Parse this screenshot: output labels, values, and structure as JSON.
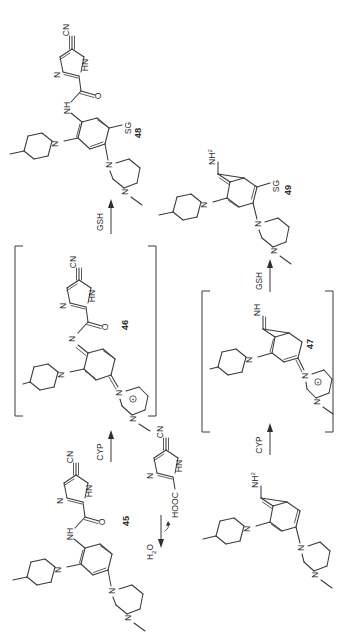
{
  "figure": {
    "type": "chemical-reaction-scheme",
    "orientation": "rotated-90-ccw",
    "background_color": "#ffffff",
    "line_color": "#3a3a3a",
    "text_color": "#2b2b2b"
  },
  "compounds": {
    "c45": {
      "label": "45",
      "atoms": {
        "cn": "CN",
        "nh_imidazole": "HN",
        "n_imidazole": "N",
        "carbonyl_o": "O",
        "amide_nh": "NH",
        "piperidine_n": "N",
        "piperazine_n1": "N",
        "piperazine_n4": "N"
      }
    },
    "c46": {
      "label": "46",
      "bracketed": true,
      "atoms": {
        "cn": "CN",
        "nh_imidazole": "HN",
        "n_imidazole": "N",
        "carbonyl_o": "O",
        "imine_n": "N",
        "piperidine_n": "N",
        "iminium_n": "N",
        "piperazine_n4": "N",
        "charge": "⊕"
      }
    },
    "c47": {
      "label": "47",
      "bracketed": true,
      "atoms": {
        "imine_nh": "NH",
        "piperidine_n": "N",
        "iminium_n": "N",
        "piperazine_n4": "N",
        "charge": "⊕"
      }
    },
    "c48": {
      "label": "48",
      "atoms": {
        "cn": "CN",
        "nh_imidazole": "HN",
        "n_imidazole": "N",
        "carbonyl_o": "O",
        "amide_nh": "NH",
        "piperidine_n": "N",
        "sg": "SG",
        "piperazine_n1": "N",
        "piperazine_n4": "N"
      }
    },
    "c49": {
      "label": "49",
      "atoms": {
        "nh2": "NH",
        "nh2_sub": "2",
        "piperidine_n": "N",
        "sg": "SG",
        "piperazine_n1": "N",
        "piperazine_n4": "N"
      }
    },
    "aniline": {
      "label": "",
      "atoms": {
        "nh2": "NH",
        "nh2_sub": "2",
        "piperidine_n": "N",
        "piperazine_n1": "N",
        "piperazine_n4": "N"
      }
    },
    "acid_fragment": {
      "label": "",
      "atoms": {
        "cn": "CN",
        "nh_imidazole": "HN",
        "n_imidazole": "N",
        "cooh": "HOOC"
      }
    }
  },
  "reactions": [
    {
      "id": "r1",
      "reagent": "CYP",
      "from": "45",
      "to": "46"
    },
    {
      "id": "r2",
      "reagent": "GSH",
      "from": "46",
      "to": "48"
    },
    {
      "id": "r3",
      "reagent": "H2O",
      "reagent_text": "H",
      "reagent_sub": "2",
      "reagent_tail": "O",
      "from": "45",
      "to": "aniline"
    },
    {
      "id": "r4",
      "reagent": "CYP",
      "from": "aniline",
      "to": "47"
    },
    {
      "id": "r5",
      "reagent": "GSH",
      "from": "47",
      "to": "49"
    }
  ],
  "labels": {
    "cyp": "CYP",
    "gsh": "GSH",
    "water_main": "H",
    "water_sub": "2",
    "water_tail": "O"
  }
}
